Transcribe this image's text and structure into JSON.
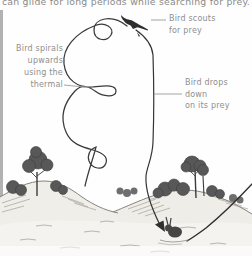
{
  "heading": {
    "text": "can glide for long periods while searching for prey."
  },
  "labels": {
    "scouts": "Bird scouts\nfor prey",
    "spirals": "Bird spirals\nupwards\nusing the\nthermal",
    "drops": "Bird drops down\non its prey"
  },
  "figures": {
    "bird": "soaring-bird-silhouette",
    "prey": "rabbit-on-ground",
    "paths": [
      "spiral-thermal-flight-path",
      "vertical-drop-flight-path",
      "swoop-flight-path"
    ]
  },
  "colors": {
    "heading_text": "#8a8a8a",
    "label_text": "#8f8f8f",
    "line_art": "#3a3a3a",
    "tree_fill": "#585858",
    "ground_fill": "#f0eee9",
    "edge_strip": "#b2b2b2"
  }
}
